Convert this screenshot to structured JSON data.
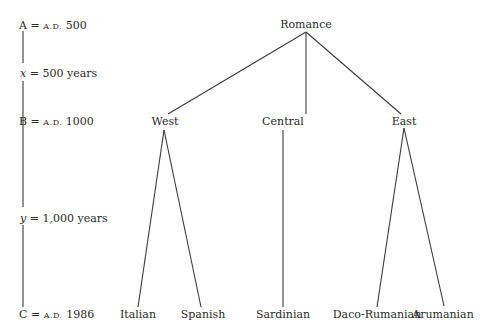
{
  "timeline": {
    "points": [
      {
        "var": "A",
        "eq": "=",
        "era": "A.D.",
        "value": "500"
      },
      {
        "var": "x",
        "eq": "=",
        "value": "500 years"
      },
      {
        "var": "B",
        "eq": "=",
        "era": "A.D.",
        "value": "1000"
      },
      {
        "var": "y",
        "eq": "=",
        "value": "1,000 years"
      },
      {
        "var": "C",
        "eq": "=",
        "era": "A.D.",
        "value": "1986"
      }
    ]
  },
  "tree": {
    "root": "Romance",
    "branches": [
      {
        "label": "West",
        "children": [
          "Italian",
          "Spanish"
        ]
      },
      {
        "label": "Central",
        "children": [
          "Sardinian"
        ]
      },
      {
        "label": "East",
        "children": [
          "Daco-Rumanian",
          "Arumanian"
        ]
      }
    ]
  },
  "colors": {
    "line": "#3a3a3a",
    "text": "#2a2a2a",
    "background": "#ffffff"
  }
}
